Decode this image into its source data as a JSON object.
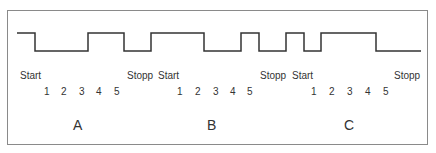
{
  "diagram": {
    "type": "serial-signal-timing",
    "colors": {
      "line": "#333333",
      "border": "#8a8a8a",
      "background": "#ffffff"
    },
    "waveform": {
      "high_y": 33,
      "low_y": 51,
      "points": [
        [
          17,
          33
        ],
        [
          35,
          33
        ],
        [
          35,
          51
        ],
        [
          88,
          51
        ],
        [
          88,
          33
        ],
        [
          124,
          33
        ],
        [
          124,
          51
        ],
        [
          151,
          51
        ],
        [
          151,
          33
        ],
        [
          204,
          33
        ],
        [
          204,
          51
        ],
        [
          241,
          51
        ],
        [
          241,
          33
        ],
        [
          259,
          33
        ],
        [
          259,
          51
        ],
        [
          286,
          51
        ],
        [
          286,
          33
        ],
        [
          304,
          33
        ],
        [
          304,
          51
        ],
        [
          321,
          51
        ],
        [
          321,
          33
        ],
        [
          376,
          33
        ],
        [
          376,
          51
        ],
        [
          421,
          51
        ]
      ]
    },
    "frames": [
      {
        "id": "A",
        "label": "A",
        "start_label": "Start",
        "stop_label": "Stopp",
        "bits": [
          "1",
          "2",
          "3",
          "4",
          "5"
        ]
      },
      {
        "id": "B",
        "label": "B",
        "start_label": "Start",
        "stop_label": "Stopp",
        "bits": [
          "1",
          "2",
          "3",
          "4",
          "5"
        ]
      },
      {
        "id": "C",
        "label": "C",
        "start_label": "Start",
        "stop_label": "Stopp",
        "bits": [
          "1",
          "2",
          "3",
          "4",
          "5"
        ]
      }
    ]
  }
}
